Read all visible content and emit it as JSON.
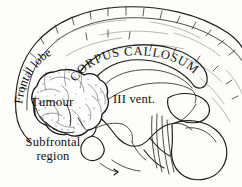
{
  "figure": {
    "type": "anatomical-line-diagram",
    "background_color": "#fdfdfc",
    "ink_color": "#1a1a1a",
    "width": 242,
    "height": 187
  },
  "labels": {
    "frontal_lobe": "Frontal lobe",
    "corpus_callosum": "CORPUS CALLOSUM",
    "tumour": "Tumour",
    "third_ventricle": "III vent.",
    "subfrontal_region_line1": "Subfrontal",
    "subfrontal_region_line2": "region",
    "subfrontal_region": "Subfrontal region"
  },
  "structures": [
    {
      "name": "cerebral-cortex-outline",
      "style": "solid-outline-with-sulcal-ticks"
    },
    {
      "name": "corpus-callosum",
      "style": "curved-band"
    },
    {
      "name": "fornix",
      "style": "thin-arc"
    },
    {
      "name": "third-ventricle",
      "style": "open-space"
    },
    {
      "name": "tumour-mass",
      "style": "stippled-lobulated-sphere"
    },
    {
      "name": "pituitary-gland",
      "style": "small-pendant-loop"
    },
    {
      "name": "brainstem",
      "style": "striated-column"
    },
    {
      "name": "cerebellum",
      "style": "rounded-lobe"
    },
    {
      "name": "subfrontal-region",
      "style": "basal-frontal-area"
    }
  ]
}
